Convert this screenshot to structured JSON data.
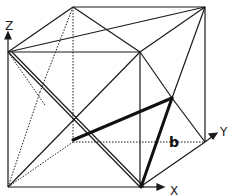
{
  "diagram": {
    "type": "cube-projection",
    "axes": {
      "x_label": "X",
      "y_label": "Y",
      "z_label": "Z"
    },
    "annotation": {
      "vector_label": "b"
    },
    "colors": {
      "line": "#1a1a1a",
      "background": "#ffffff"
    }
  }
}
